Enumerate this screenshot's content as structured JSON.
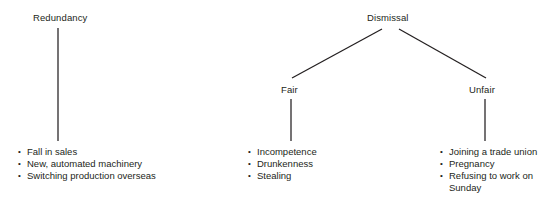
{
  "diagram": {
    "background_color": "#ffffff",
    "line_color": "#231f20",
    "text_color": "#231f20",
    "trees": [
      {
        "id": "redundancy",
        "root": {
          "label": "Redundancy"
        },
        "reasons": [
          "Fall in sales",
          "New, automated machinery",
          "Switching production overseas"
        ]
      },
      {
        "id": "dismissal",
        "root": {
          "label": "Dismissal"
        },
        "branches": [
          {
            "id": "fair",
            "label": "Fair",
            "reasons": [
              "Incompetence",
              "Drunkenness",
              "Stealing"
            ]
          },
          {
            "id": "unfair",
            "label": "Unfair",
            "reasons": [
              "Joining a trade union",
              "Pregnancy",
              "Refusing to work on Sunday"
            ]
          }
        ]
      }
    ]
  }
}
